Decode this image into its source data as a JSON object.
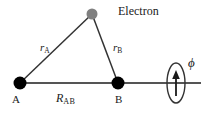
{
  "figure": {
    "background_color": "#ffffff",
    "line_color": "#4d4d4d",
    "nucleus_color": "#000000",
    "electron_color": "#808080",
    "text_color": "#1a1a1a",
    "width": 209,
    "height": 114
  },
  "labels": {
    "electron": "Electron",
    "point_a": "A",
    "point_b": "B",
    "r_a_var": "r",
    "r_a_sub": "A",
    "r_b_var": "r",
    "r_b_sub": "B",
    "r_ab_var": "R",
    "r_ab_sub": "AB",
    "phi": "ϕ"
  },
  "geometry": {
    "nucleus_a": {
      "x": 20,
      "y": 83,
      "radius": 6.5
    },
    "nucleus_b": {
      "x": 118,
      "y": 83,
      "radius": 6.5
    },
    "electron": {
      "x": 92,
      "y": 14,
      "radius": 5.5
    },
    "axis_line": {
      "x1": 20,
      "y1": 83,
      "x2": 201,
      "y2": 83
    },
    "bond_r_a": {
      "x1": 20,
      "y1": 83,
      "x2": 92,
      "y2": 14
    },
    "bond_r_b": {
      "x1": 92,
      "y1": 14,
      "x2": 118,
      "y2": 83
    },
    "rotation_ellipse": {
      "cx": 176,
      "cy": 83,
      "rx": 9,
      "ry": 20
    },
    "rotation_arrow": {
      "x": 176,
      "y_tail": 95,
      "y_head": 72
    }
  }
}
